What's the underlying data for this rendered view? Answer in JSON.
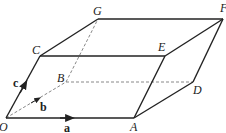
{
  "diagram": {
    "type": "parallelepiped",
    "vertices": {
      "O": {
        "label": "O",
        "x": 6,
        "y": 118
      },
      "A": {
        "label": "A",
        "x": 134,
        "y": 118
      },
      "B": {
        "label": "B",
        "x": 66,
        "y": 82
      },
      "D": {
        "label": "D",
        "x": 193,
        "y": 82
      },
      "C": {
        "label": "C",
        "x": 40,
        "y": 56
      },
      "E": {
        "label": "E",
        "x": 165,
        "y": 56
      },
      "G": {
        "label": "G",
        "x": 98,
        "y": 19
      },
      "F": {
        "label": "F",
        "x": 223,
        "y": 19
      }
    },
    "vectors": {
      "a": {
        "label": "a",
        "from": "O",
        "to": "A"
      },
      "b": {
        "label": "b",
        "from": "O",
        "to": "B"
      },
      "c": {
        "label": "c",
        "from": "O",
        "to": "C"
      }
    },
    "solid_edges": [
      "OA",
      "OC",
      "AD",
      "AE",
      "CE",
      "CG",
      "GF",
      "EF",
      "DF"
    ],
    "hidden_edges": [
      "OB",
      "BD",
      "BG"
    ],
    "colors": {
      "line": "#222222",
      "hidden": "#888888",
      "background": "#ffffff"
    }
  }
}
